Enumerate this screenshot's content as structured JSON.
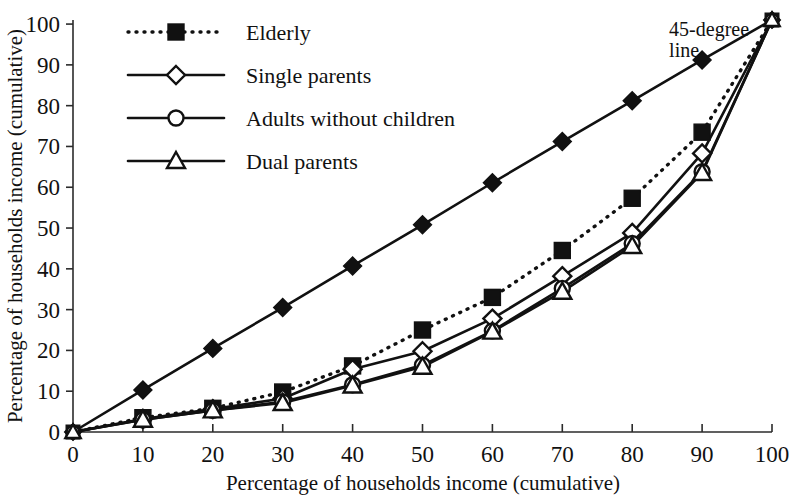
{
  "chart_data": {
    "type": "line",
    "title": "",
    "xlabel": "Percentage of households income (cumulative)",
    "ylabel": "Percentage of households income (cumulative)",
    "xlim": [
      0,
      100
    ],
    "ylim": [
      0,
      100
    ],
    "xticks": [
      "0",
      "10",
      "20",
      "30",
      "40",
      "50",
      "60",
      "70",
      "80",
      "90",
      "100"
    ],
    "yticks": [
      "0",
      "10",
      "20",
      "30",
      "40",
      "50",
      "60",
      "70",
      "80",
      "90",
      "100"
    ],
    "grid": false,
    "legend_position": "upper-left-inside",
    "x": [
      0,
      10,
      20,
      30,
      40,
      50,
      60,
      70,
      80,
      90,
      100
    ],
    "series": [
      {
        "name": "45-degree line",
        "marker": "diamond-filled",
        "linestyle": "solid",
        "values": [
          0,
          10.3,
          20.5,
          30.5,
          40.7,
          50.8,
          61.1,
          71.2,
          81.2,
          91.2,
          101
        ]
      },
      {
        "name": "Elderly",
        "marker": "square-filled",
        "linestyle": "dotted",
        "values": [
          0,
          3.5,
          5.8,
          9.8,
          16.2,
          25,
          33,
          44.5,
          57.3,
          73.5,
          101
        ]
      },
      {
        "name": "Single parents",
        "marker": "diamond-open",
        "linestyle": "solid",
        "values": [
          0,
          3.2,
          5.6,
          8.2,
          15.4,
          19.8,
          27.8,
          38.2,
          48.8,
          68.3,
          101
        ]
      },
      {
        "name": "Adults without children",
        "marker": "circle-open",
        "linestyle": "solid",
        "values": [
          0,
          3,
          5.3,
          7.4,
          11.6,
          16.4,
          24.8,
          35.2,
          46.2,
          63.8,
          101
        ]
      },
      {
        "name": "Dual parents",
        "marker": "triangle-open",
        "linestyle": "solid",
        "values": [
          0,
          3,
          5.3,
          7.1,
          11.4,
          16,
          24.6,
          34.4,
          45.6,
          63.5,
          101
        ]
      }
    ],
    "annotations": [
      {
        "text": "45-degree",
        "x": 90,
        "y": 97
      },
      {
        "text": "line",
        "x": 90,
        "y": 92
      }
    ],
    "legend_entries": [
      {
        "label": "Elderly",
        "marker": "square-filled",
        "linestyle": "dotted"
      },
      {
        "label": "Single parents",
        "marker": "diamond-open",
        "linestyle": "solid"
      },
      {
        "label": "Adults without children",
        "marker": "circle-open",
        "linestyle": "solid"
      },
      {
        "label": "Dual parents",
        "marker": "triangle-open",
        "linestyle": "solid"
      }
    ],
    "colors": {
      "line": "#111111",
      "axis": "#2b2b2b",
      "background": "#ffffff",
      "marker_fill_open": "#ffffff",
      "marker_fill_solid": "#111111"
    }
  }
}
